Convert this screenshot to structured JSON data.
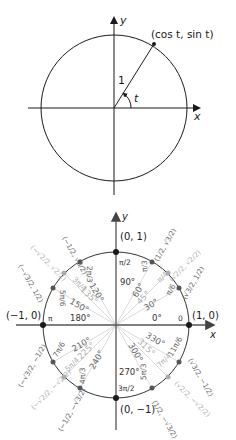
{
  "figure_top": {
    "axis_x_label": "x",
    "axis_y_label": "y",
    "radius_label": "1",
    "angle_label": "t",
    "point_label": "(cos t, sin t)"
  },
  "figure_bottom": {
    "axis_x_label": "x",
    "axis_y_label": "y",
    "axis_points": {
      "right": "(1, 0)",
      "top": "(0, 1)",
      "left": "(−1, 0)",
      "bottom": "(0, −1)"
    },
    "angles": [
      {
        "deg": "0°",
        "rad": "0"
      },
      {
        "deg": "30°",
        "rad": "π/6"
      },
      {
        "deg": "45°",
        "rad": "π/4"
      },
      {
        "deg": "60°",
        "rad": "π/3"
      },
      {
        "deg": "90°",
        "rad": "π/2"
      },
      {
        "deg": "120°",
        "rad": "2π/3"
      },
      {
        "deg": "135°",
        "rad": "3π/4"
      },
      {
        "deg": "150°",
        "rad": "5π/6"
      },
      {
        "deg": "180°",
        "rad": "π"
      },
      {
        "deg": "210°",
        "rad": "7π/6"
      },
      {
        "deg": "225°",
        "rad": "5π/4"
      },
      {
        "deg": "240°",
        "rad": "4π/3"
      },
      {
        "deg": "270°",
        "rad": "3π/2"
      },
      {
        "deg": "300°",
        "rad": "5π/3"
      },
      {
        "deg": "315°",
        "rad": "7π/4"
      },
      {
        "deg": "330°",
        "rad": "11π/6"
      }
    ],
    "coords": {
      "a30": "(√3/2, 1/2)",
      "a45": "(√2/2, √2/2)",
      "a60": "(1/2, √3/2)",
      "a120": "(−1/2, √3/2)",
      "a135": "(−√2/2, √2/2)",
      "a150": "(−√3/2, 1/2)",
      "a210": "(−√3/2, −1/2)",
      "a225": "(−√2/2, −√2/2)",
      "a240": "(−1/2, −√3/2)",
      "a300": "(1/2, −√3/2)",
      "a315": "(√2/2, −√2/2)",
      "a330": "(√3/2, −1/2)"
    },
    "colors": {
      "axis": "#555555",
      "circle": "#333333",
      "pi6_points": "#555555",
      "pi4_points": "#aaaaaa",
      "ray_light": "#cccccc"
    }
  }
}
